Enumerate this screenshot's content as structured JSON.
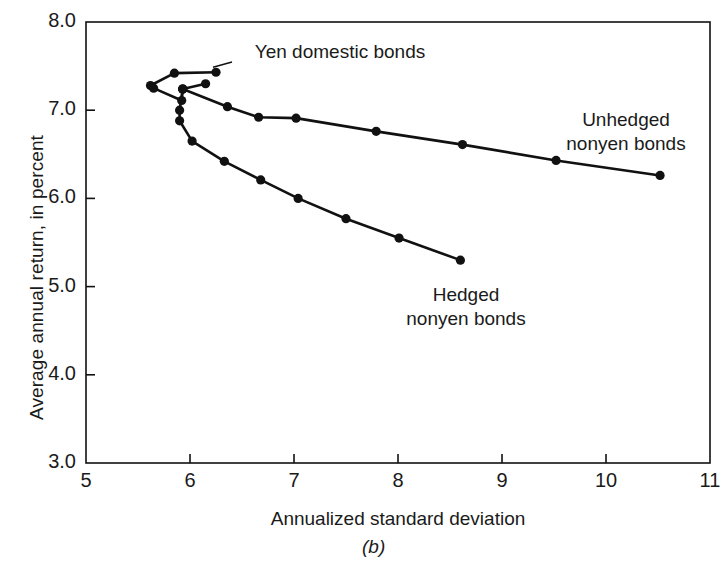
{
  "figure": {
    "caption": "(b)",
    "xlabel": "Annualized standard deviation",
    "ylabel": "Average annual return, in percent",
    "ink_color": "#111111",
    "background": "#ffffff"
  },
  "axes": {
    "x_ticks": [
      "5",
      "6",
      "7",
      "8",
      "9",
      "10",
      "11"
    ],
    "y_ticks": [
      "8.0",
      "7.0",
      "6.0",
      "5.0",
      "4.0",
      "3.0"
    ]
  },
  "annotations": [
    {
      "id": "yen-domestic-label",
      "text_line1": "Yen domestic bonds",
      "text_line2": ""
    },
    {
      "id": "unhedged-label",
      "text_line1": "Unhedged",
      "text_line2": "nonyen bonds"
    },
    {
      "id": "hedged-label",
      "text_line1": "Hedged",
      "text_line2": "nonyen bonds"
    }
  ],
  "chart_data": {
    "type": "line",
    "title": "",
    "xlabel": "Annualized standard deviation",
    "ylabel": "Average annual return, in percent",
    "xlim": [
      5,
      11
    ],
    "ylim": [
      3.0,
      8.0
    ],
    "xticks": [
      5,
      6,
      7,
      8,
      9,
      10,
      11
    ],
    "yticks": [
      3.0,
      4.0,
      5.0,
      6.0,
      7.0,
      8.0
    ],
    "grid": false,
    "legend": "inline-annotations",
    "marker": "filled-circle",
    "series": [
      {
        "name": "Yen domestic bonds",
        "points": [
          [
            6.25,
            7.43
          ],
          [
            5.85,
            7.42
          ],
          [
            5.62,
            7.28
          ],
          [
            5.65,
            7.25
          ],
          [
            5.92,
            7.11
          ],
          [
            5.93,
            7.24
          ],
          [
            6.15,
            7.3
          ]
        ]
      },
      {
        "name": "Unhedged nonyen bonds",
        "points": [
          [
            5.93,
            7.24
          ],
          [
            6.36,
            7.04
          ],
          [
            6.66,
            6.92
          ],
          [
            7.02,
            6.91
          ],
          [
            7.79,
            6.76
          ],
          [
            8.62,
            6.61
          ],
          [
            9.52,
            6.43
          ],
          [
            10.52,
            6.26
          ]
        ]
      },
      {
        "name": "Hedged nonyen bonds",
        "points": [
          [
            5.93,
            7.24
          ],
          [
            5.9,
            7.0
          ],
          [
            5.9,
            6.88
          ],
          [
            6.02,
            6.65
          ],
          [
            6.33,
            6.42
          ],
          [
            6.68,
            6.21
          ],
          [
            7.04,
            6.0
          ],
          [
            7.5,
            5.77
          ],
          [
            8.01,
            5.55
          ],
          [
            8.6,
            5.3
          ]
        ]
      }
    ]
  }
}
